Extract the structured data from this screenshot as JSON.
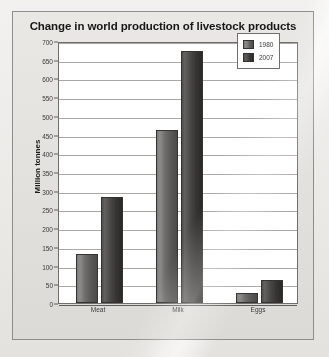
{
  "chart_data": {
    "type": "bar",
    "title": "Change in world production of livestock products",
    "xlabel": "",
    "ylabel": "Million tonnes",
    "categories": [
      "Meat",
      "Milk",
      "Eggs"
    ],
    "series": [
      {
        "name": "1980",
        "color": "#6d6c6a",
        "values": [
          130,
          462,
          26
        ]
      },
      {
        "name": "2007",
        "color": "#3a3937",
        "values": [
          283,
          672,
          62
        ]
      }
    ],
    "ylim": [
      0,
      700
    ],
    "ytick_step": 50,
    "yticks": [
      0,
      50,
      100,
      150,
      200,
      250,
      300,
      350,
      400,
      450,
      500,
      550,
      600,
      650,
      700
    ],
    "ytick_labels": [
      "0",
      "50",
      "100",
      "150",
      "200",
      "250",
      "300",
      "350",
      "400",
      "450",
      "500",
      "550",
      "600",
      "650",
      "700"
    ],
    "grid": true,
    "legend_position": "top-right"
  },
  "legend": {
    "entries": [
      {
        "label": "1980"
      },
      {
        "label": "2007"
      }
    ]
  }
}
